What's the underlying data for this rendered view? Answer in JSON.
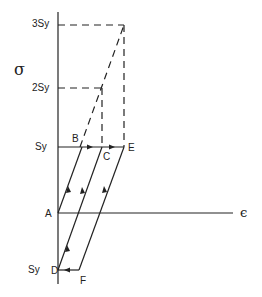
{
  "diagram": {
    "type": "stress-strain cyclic loading diagram",
    "axes": {
      "y_label": "σ",
      "x_label": "ϵ"
    },
    "y_levels": [
      {
        "label": "3Sy",
        "y": 25
      },
      {
        "label": "2Sy",
        "y": 88
      },
      {
        "label": "Sy",
        "y": 147
      },
      {
        "label": "Sy",
        "y": 270
      }
    ],
    "points": {
      "A": "A",
      "B": "B",
      "C": "C",
      "D": "D",
      "E": "E",
      "F": "F"
    },
    "colors": {
      "line": "#222222",
      "background": "#ffffff"
    }
  }
}
